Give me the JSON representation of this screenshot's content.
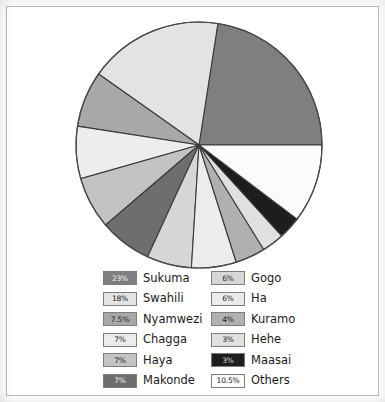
{
  "figure": {
    "background_color": "#ffffff",
    "frame_color": "#b9b9b6",
    "slice_outline_color": "#3a3a3a"
  },
  "chart_data": {
    "type": "pie",
    "title": "",
    "subtitle": "",
    "xlabel": "",
    "ylabel": "",
    "grid": false,
    "legend_position": "bottom",
    "units": "percent",
    "start_angle_deg": 0,
    "direction": "counterclockwise",
    "center": {
      "x": 192,
      "y": 137,
      "radius": 124
    },
    "total_percent": 101,
    "categories": [
      "Sukuma",
      "Swahili",
      "Nyamwezi",
      "Chagga",
      "Haya",
      "Makonde",
      "Gogo",
      "Ha",
      "Kuramo",
      "Hehe",
      "Maasai",
      "Others"
    ],
    "values": [
      23,
      18,
      7.5,
      7,
      7,
      7,
      6,
      6,
      4,
      3,
      3,
      10.5
    ],
    "labels": [
      "23%",
      "18%",
      "7.5%",
      "7%",
      "7%",
      "7%",
      "6%",
      "6%",
      "4%",
      "3%",
      "3%",
      "10.5%"
    ],
    "colors": [
      "#7f7f7f",
      "#e3e3e3",
      "#a8a8a8",
      "#ededed",
      "#c3c3c3",
      "#6e6e6e",
      "#d6d6d6",
      "#ececec",
      "#b0b0b0",
      "#e0e0e0",
      "#1d1d1d",
      "#fbfbfb"
    ],
    "slices": [
      {
        "name": "Sukuma",
        "value": 23,
        "label": "23%",
        "color": "#7f7f7f",
        "text_color": "#f2f2f2"
      },
      {
        "name": "Swahili",
        "value": 18,
        "label": "18%",
        "color": "#e3e3e3",
        "text_color": "#1a1a1a"
      },
      {
        "name": "Nyamwezi",
        "value": 7.5,
        "label": "7.5%",
        "color": "#a8a8a8",
        "text_color": "#1a1a1a"
      },
      {
        "name": "Chagga",
        "value": 7,
        "label": "7%",
        "color": "#ededed",
        "text_color": "#1a1a1a"
      },
      {
        "name": "Haya",
        "value": 7,
        "label": "7%",
        "color": "#c3c3c3",
        "text_color": "#1a1a1a"
      },
      {
        "name": "Makonde",
        "value": 7,
        "label": "7%",
        "color": "#6e6e6e",
        "text_color": "#f2f2f2"
      },
      {
        "name": "Gogo",
        "value": 6,
        "label": "6%",
        "color": "#d6d6d6",
        "text_color": "#1a1a1a"
      },
      {
        "name": "Ha",
        "value": 6,
        "label": "6%",
        "color": "#ececec",
        "text_color": "#1a1a1a"
      },
      {
        "name": "Kuramo",
        "value": 4,
        "label": "4%",
        "color": "#b0b0b0",
        "text_color": "#1a1a1a"
      },
      {
        "name": "Hehe",
        "value": 3,
        "label": "3%",
        "color": "#e0e0e0",
        "text_color": "#1a1a1a"
      },
      {
        "name": "Maasai",
        "value": 3,
        "label": "3%",
        "color": "#1d1d1d",
        "text_color": "#d8d8d8"
      },
      {
        "name": "Others",
        "value": 10.5,
        "label": "10.5%",
        "color": "#fbfbfb",
        "text_color": "#1a1a1a"
      }
    ]
  },
  "legend": {
    "columns": [
      {
        "id": "left",
        "rows": [
          {
            "label": "Sukuma",
            "pct": "23%",
            "color": "#7f7f7f",
            "text_color": "#f2f2f2"
          },
          {
            "label": "Swahili",
            "pct": "18%",
            "color": "#e3e3e3",
            "text_color": "#1a1a1a"
          },
          {
            "label": "Nyamwezi",
            "pct": "7.5%",
            "color": "#a8a8a8",
            "text_color": "#1a1a1a"
          },
          {
            "label": "Chagga",
            "pct": "7%",
            "color": "#ededed",
            "text_color": "#1a1a1a"
          },
          {
            "label": "Haya",
            "pct": "7%",
            "color": "#c3c3c3",
            "text_color": "#1a1a1a"
          },
          {
            "label": "Makonde",
            "pct": "7%",
            "color": "#6e6e6e",
            "text_color": "#f2f2f2"
          }
        ]
      },
      {
        "id": "right",
        "rows": [
          {
            "label": "Gogo",
            "pct": "6%",
            "color": "#d6d6d6",
            "text_color": "#1a1a1a"
          },
          {
            "label": "Ha",
            "pct": "6%",
            "color": "#ececec",
            "text_color": "#1a1a1a"
          },
          {
            "label": "Kuramo",
            "pct": "4%",
            "color": "#b0b0b0",
            "text_color": "#1a1a1a"
          },
          {
            "label": "Hehe",
            "pct": "3%",
            "color": "#e0e0e0",
            "text_color": "#1a1a1a"
          },
          {
            "label": "Maasai",
            "pct": "3%",
            "color": "#1d1d1d",
            "text_color": "#d8d8d8"
          },
          {
            "label": "Others",
            "pct": "10.5%",
            "color": "#fbfbfb",
            "text_color": "#1a1a1a"
          }
        ]
      }
    ]
  }
}
